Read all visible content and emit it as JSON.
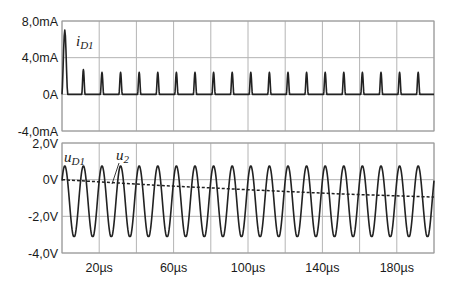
{
  "chart_data": [
    {
      "type": "line",
      "title": "",
      "xlabel": "",
      "ylabel": "",
      "xlim": [
        0,
        200
      ],
      "x_unit": "µs",
      "ylim": [
        -4,
        8
      ],
      "y_unit": "mA",
      "yticks": [
        8,
        4,
        0,
        -4
      ],
      "ytick_labels": [
        "8,0mA",
        "4,0mA",
        "0A",
        "-4,0mA"
      ],
      "grid": true,
      "series": [
        {
          "name": "i_D1",
          "style": "solid",
          "description": "Diode current pulses, one per 10µs period",
          "peak_times_us": [
            1.5,
            11.5,
            21.5,
            31.5,
            41.5,
            51.5,
            61.5,
            71.5,
            81.5,
            91.5,
            101.5,
            111.5,
            121.5,
            131.5,
            141.5,
            151.5,
            161.5,
            171.5,
            181.5,
            191.5
          ],
          "peak_values_mA": [
            7.0,
            2.7,
            2.4,
            2.4,
            2.4,
            2.4,
            2.4,
            2.4,
            2.4,
            2.4,
            2.4,
            2.4,
            2.4,
            2.4,
            2.4,
            2.4,
            2.4,
            2.4,
            2.4,
            2.4
          ],
          "baseline_mA": 0
        }
      ]
    },
    {
      "type": "line",
      "title": "",
      "xlabel": "",
      "ylabel": "",
      "xlim": [
        0,
        200
      ],
      "x_unit": "µs",
      "xticks": [
        20,
        60,
        100,
        140,
        180
      ],
      "xtick_labels": [
        "20µs",
        "60µs",
        "100µs",
        "140µs",
        "180µs"
      ],
      "ylim": [
        -4,
        2
      ],
      "y_unit": "V",
      "yticks": [
        2,
        0,
        -2,
        -4
      ],
      "ytick_labels": [
        "2,0V",
        "0V",
        "-2,0V",
        "-4,0V"
      ],
      "grid": true,
      "series": [
        {
          "name": "u_D1",
          "style": "solid",
          "description": "Sinusoid, period 10µs, max clipped ≈ 0.75V, min ≈ -3.1V",
          "period_us": 10,
          "max_V": 0.75,
          "min_V": -3.1,
          "first_peak_us": 1.5
        },
        {
          "name": "u_2",
          "style": "dashed",
          "description": "Slowly decreasing voltage",
          "x": [
            0,
            50,
            100,
            150,
            200
          ],
          "y": [
            0.0,
            -0.3,
            -0.55,
            -0.78,
            -0.95
          ]
        }
      ]
    }
  ],
  "labels": {
    "top_series_main": "i",
    "top_series_sub": "D1",
    "bottom_series1_main": "u",
    "bottom_series1_sub": "D1",
    "bottom_series2_main": "u",
    "bottom_series2_sub": "2"
  },
  "colors": {
    "trace": "#222222",
    "grid": "#b4b4b4",
    "background": "#ffffff"
  }
}
